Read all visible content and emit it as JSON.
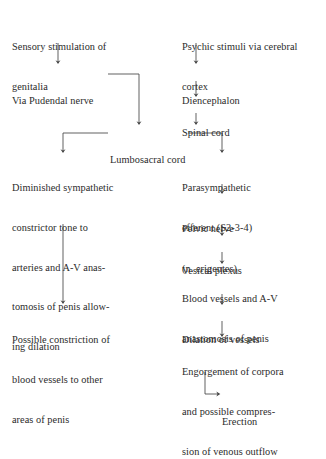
{
  "diagram": {
    "background_color": "#ffffff",
    "text_color": "#2b2b2b",
    "line_color": "#444444",
    "nodes": [
      {
        "id": "sensory-stimulation",
        "lines": [
          "Sensory stimulation of",
          "genitalia"
        ],
        "x": 12,
        "y": 14
      },
      {
        "id": "psychic-stimuli",
        "lines": [
          "Psychic stimuli via cerebral",
          "cortex"
        ],
        "x": 182,
        "y": 14
      },
      {
        "id": "via-pudendal-nerve",
        "lines": [
          "Via Pudendal nerve"
        ],
        "x": 12,
        "y": 68
      },
      {
        "id": "diencephalon",
        "lines": [
          "Diencephalon"
        ],
        "x": 182,
        "y": 68
      },
      {
        "id": "spinal-cord",
        "lines": [
          "Spinal cord"
        ],
        "x": 182,
        "y": 100
      },
      {
        "id": "lumbosacral-cord",
        "lines": [
          "Lumbosacral cord"
        ],
        "x": 110,
        "y": 127
      },
      {
        "id": "diminished-sympathetic",
        "lines": [
          "Diminished sympathetic",
          "constrictor tone to",
          "arteries and A-V anas-",
          "tomosis of penis allow-",
          "ing dilation"
        ],
        "x": 12,
        "y": 155
      },
      {
        "id": "parasympathetic-efferent",
        "lines": [
          "Parasympathetic",
          "efferent (S2-3-4)"
        ],
        "x": 182,
        "y": 155
      },
      {
        "id": "pelvic-nerve",
        "lines": [
          "Pelvic nerve",
          "(n. erigentes)"
        ],
        "x": 182,
        "y": 196
      },
      {
        "id": "vesical-plexus",
        "lines": [
          "Vesical plexus"
        ],
        "x": 182,
        "y": 238
      },
      {
        "id": "blood-vessels-av",
        "lines": [
          "Blood vessels and A-V",
          "anastomosis of penis"
        ],
        "x": 182,
        "y": 266
      },
      {
        "id": "dilation-of-vessels",
        "lines": [
          "Dilation of vessels"
        ],
        "x": 182,
        "y": 307
      },
      {
        "id": "possible-constriction",
        "lines": [
          "Possible constriction of",
          "blood vessels to other",
          "areas of penis"
        ],
        "x": 12,
        "y": 307
      },
      {
        "id": "engorgement-corpora",
        "lines": [
          "Engorgement of corpora",
          "and possible compres-",
          "sion of venous outflow"
        ],
        "x": 182,
        "y": 339
      },
      {
        "id": "erection",
        "lines": [
          "Erection"
        ],
        "x": 222,
        "y": 389
      }
    ],
    "connectors": [
      {
        "id": "sensory-to-pudendal",
        "type": "arrow-down",
        "label": "genitalia to Via Pudendal nerve"
      },
      {
        "id": "psychic-to-diencephalon",
        "type": "arrow-down",
        "label": "cortex to Diencephalon"
      },
      {
        "id": "diencephalon-to-spinal",
        "type": "arrow-down",
        "label": "Diencephalon to Spinal cord"
      },
      {
        "id": "spinal-to-lumbosacral",
        "type": "arrow-down",
        "label": "Spinal cord to Lumbosacral cord"
      },
      {
        "id": "pudendal-to-lumbosacral",
        "type": "elbow-right-down-arrow",
        "label": "Via Pudendal nerve to Lumbosacral cord"
      },
      {
        "id": "lumbosacral-to-sympathetic",
        "type": "elbow-left-down-arrow",
        "label": "Lumbosacral cord to Diminished sympathetic"
      },
      {
        "id": "lumbosacral-to-parasympathetic",
        "type": "elbow-right-down-arrow",
        "label": "Lumbosacral cord to Parasympathetic efferent"
      },
      {
        "id": "sympathetic-to-constriction",
        "type": "arrow-down-long",
        "label": "ing dilation to Possible constriction"
      },
      {
        "id": "parasympathetic-to-pelvic",
        "type": "arrow-down",
        "label": "Parasympathetic efferent to Pelvic nerve"
      },
      {
        "id": "pelvic-to-vesical",
        "type": "arrow-down",
        "label": "Pelvic nerve to Vesical plexus"
      },
      {
        "id": "vesical-to-bloodvessels",
        "type": "arrow-down",
        "label": "Vesical plexus to Blood vessels"
      },
      {
        "id": "bloodvessels-to-dilation",
        "type": "arrow-down",
        "label": "Blood vessels to Dilation of vessels"
      },
      {
        "id": "dilation-to-engorgement",
        "type": "arrow-down",
        "label": "Dilation of vessels to Engorgement"
      },
      {
        "id": "engorgement-to-erection",
        "type": "elbow-down-right-arrow",
        "label": "Engorgement to Erection"
      }
    ]
  }
}
